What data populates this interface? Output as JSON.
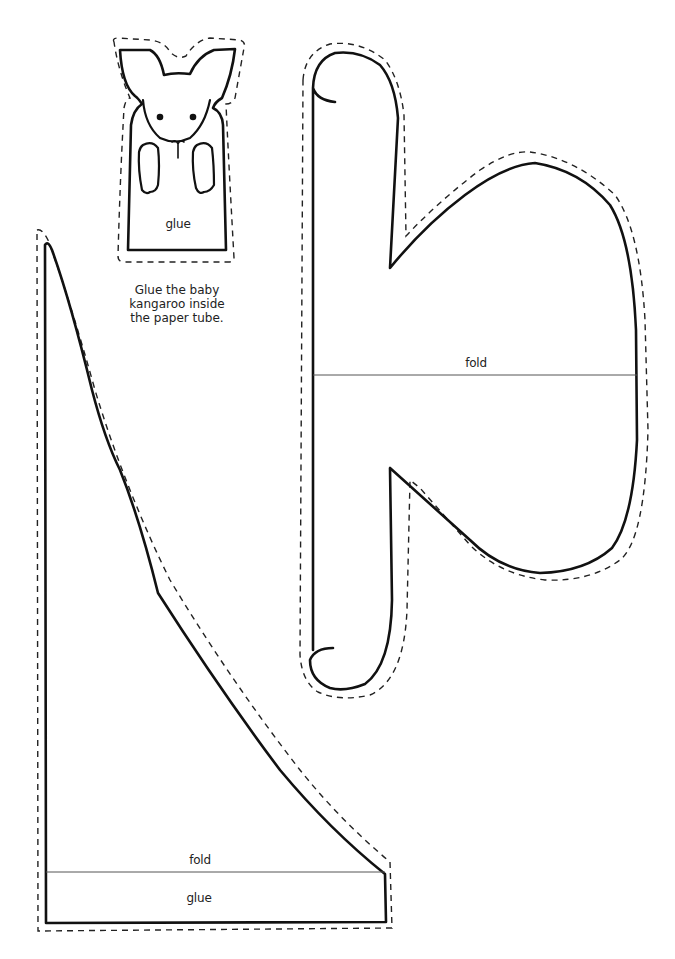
{
  "template": {
    "baby_kangaroo": {
      "glue_label": "glue"
    },
    "instruction": {
      "lines": [
        "Glue the baby",
        "kangaroo inside",
        "the paper tube."
      ]
    },
    "pouch_piece": {
      "fold_label": "fold"
    },
    "tail_piece": {
      "fold_label": "fold",
      "glue_label": "glue"
    }
  },
  "colors": {
    "background": "#ffffff",
    "line": "#111111",
    "fold_line": "#555555"
  }
}
